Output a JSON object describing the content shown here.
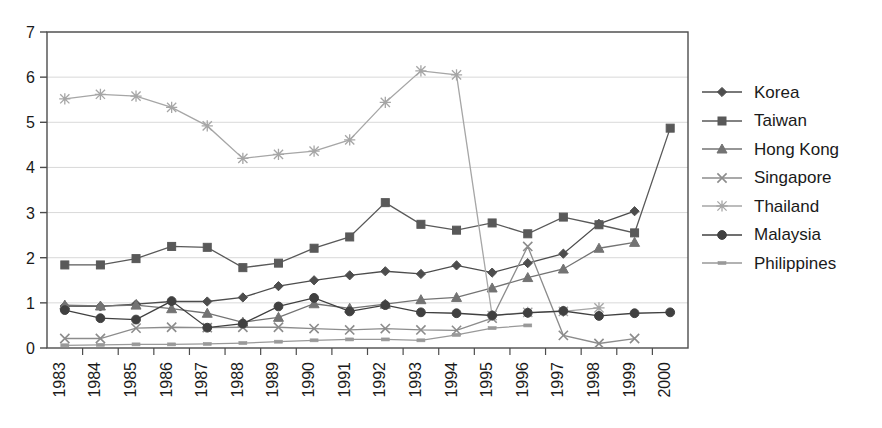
{
  "chart_data": {
    "type": "line",
    "title": "",
    "xlabel": "",
    "ylabel": "",
    "categories": [
      "1983",
      "1984",
      "1985",
      "1986",
      "1987",
      "1988",
      "1989",
      "1990",
      "1991",
      "1992",
      "1993",
      "1994",
      "1995",
      "1996",
      "1997",
      "1998",
      "1999",
      "2000"
    ],
    "ylim": [
      0,
      7
    ],
    "yticks": [
      0,
      1,
      2,
      3,
      4,
      5,
      6,
      7
    ],
    "grid": "horizontal",
    "legend_position": "right",
    "series": [
      {
        "name": "Korea",
        "marker": "diamond",
        "color": "#4d4d4d",
        "values": [
          0.93,
          0.92,
          0.97,
          1.03,
          1.03,
          1.12,
          1.37,
          1.5,
          1.61,
          1.7,
          1.64,
          1.83,
          1.67,
          1.88,
          2.09,
          2.75,
          3.03,
          null
        ]
      },
      {
        "name": "Taiwan",
        "marker": "square",
        "color": "#595959",
        "values": [
          1.84,
          1.84,
          1.98,
          2.25,
          2.23,
          1.78,
          1.88,
          2.21,
          2.46,
          3.22,
          2.74,
          2.61,
          2.77,
          2.53,
          2.9,
          2.73,
          2.55,
          4.87
        ]
      },
      {
        "name": "Hong Kong",
        "marker": "triangle",
        "color": "#737373",
        "values": [
          0.95,
          0.93,
          0.95,
          0.87,
          0.77,
          0.57,
          0.68,
          0.98,
          0.88,
          0.97,
          1.07,
          1.12,
          1.33,
          1.56,
          1.75,
          2.21,
          2.34,
          null
        ]
      },
      {
        "name": "Singapore",
        "marker": "cross",
        "color": "#8c8c8c",
        "values": [
          0.21,
          0.21,
          0.44,
          0.46,
          0.45,
          0.46,
          0.46,
          0.43,
          0.4,
          0.43,
          0.4,
          0.39,
          0.66,
          2.25,
          0.28,
          0.1,
          0.21,
          null
        ]
      },
      {
        "name": "Thailand",
        "marker": "asterisk",
        "color": "#a6a6a6",
        "values": [
          5.52,
          5.62,
          5.58,
          5.33,
          4.92,
          4.2,
          4.29,
          4.36,
          4.61,
          5.44,
          6.14,
          6.05,
          0.72,
          0.79,
          0.81,
          0.89,
          null,
          null
        ]
      },
      {
        "name": "Malaysia",
        "marker": "circle",
        "color": "#404040",
        "values": [
          0.84,
          0.66,
          0.63,
          1.04,
          0.45,
          0.54,
          0.92,
          1.11,
          0.81,
          0.95,
          0.79,
          0.77,
          0.72,
          0.78,
          0.82,
          0.71,
          0.77,
          0.79
        ]
      },
      {
        "name": "Philippines",
        "marker": "dash",
        "color": "#999999",
        "values": [
          0.06,
          0.07,
          0.08,
          0.08,
          0.09,
          0.11,
          0.14,
          0.17,
          0.19,
          0.19,
          0.17,
          0.29,
          0.44,
          0.5,
          null,
          null,
          null,
          null
        ]
      }
    ]
  },
  "legend": {
    "items": [
      {
        "label": "Korea"
      },
      {
        "label": "Taiwan"
      },
      {
        "label": "Hong Kong"
      },
      {
        "label": "Singapore"
      },
      {
        "label": "Thailand"
      },
      {
        "label": "Malaysia"
      },
      {
        "label": "Philippines"
      }
    ]
  }
}
